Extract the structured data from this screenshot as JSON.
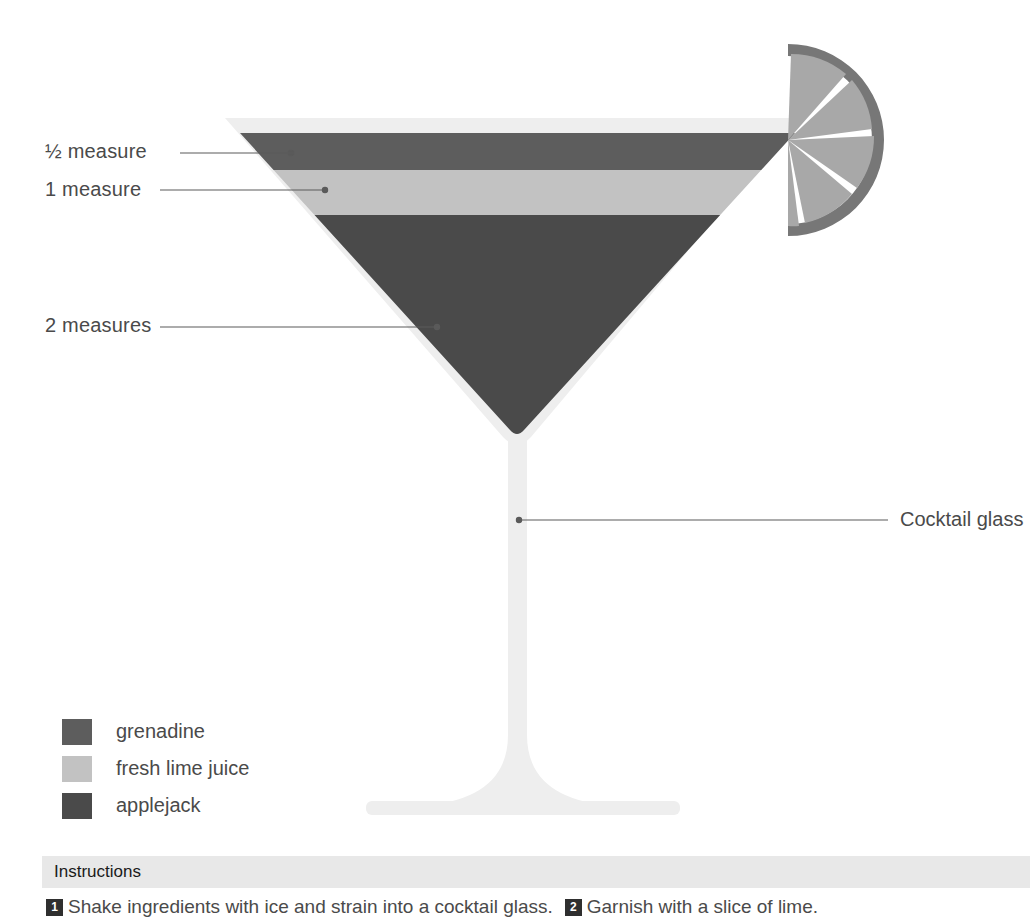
{
  "illustration": {
    "title": "layered cocktail in a cocktail glass with lime slice garnish",
    "glass_label": "Cocktail glass",
    "garnish_name": "lime-slice-garnish",
    "colors": {
      "glass": "#eeeeee",
      "glass_edge": "#e3e3e3",
      "grenadine": "#5d5d5d",
      "fresh_lime_juice": "#c2c2c2",
      "applejack": "#4a4a4a",
      "lime_rind": "#777777",
      "lime_flesh": "#a8a8a8",
      "leader_line": "#5a5a5a",
      "instructions_bar": "#e8e8e8",
      "text": "#4a4a4a"
    },
    "measures": [
      {
        "label": "½ measure",
        "ingredient": "grenadine"
      },
      {
        "label": "1 measure",
        "ingredient": "fresh lime juice"
      },
      {
        "label": "2 measures",
        "ingredient": "applejack"
      }
    ]
  },
  "legend": {
    "items": [
      {
        "label": "grenadine",
        "color": "#5d5d5d"
      },
      {
        "label": "fresh lime juice",
        "color": "#c2c2c2"
      },
      {
        "label": "applejack",
        "color": "#4a4a4a"
      }
    ]
  },
  "instructions": {
    "title": "Instructions",
    "steps": [
      {
        "num": "1",
        "text": "Shake ingredients with ice and strain into a cocktail glass."
      },
      {
        "num": "2",
        "text": "Garnish with a slice of lime."
      }
    ]
  }
}
